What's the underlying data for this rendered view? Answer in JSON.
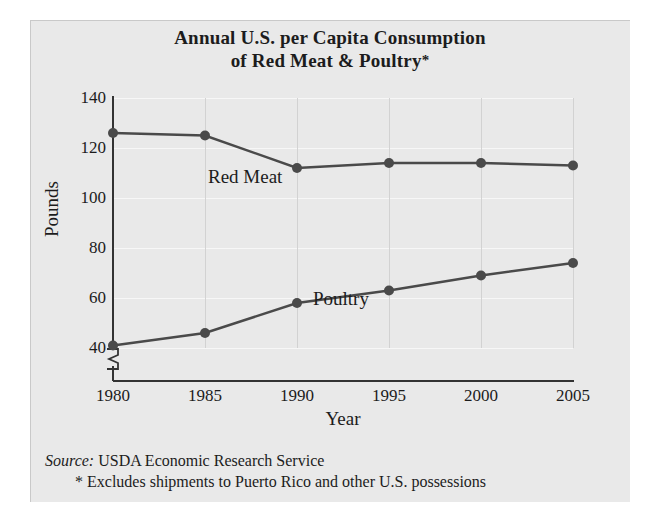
{
  "chart_data": {
    "type": "line",
    "title": "Annual U.S. per Capita Consumption of Red Meat & Poultry*",
    "title_line1": "Annual U.S. per Capita Consumption",
    "title_line2": "of Red Meat & Poultry",
    "title_asterisk": "*",
    "xlabel": "Year",
    "ylabel": "Pounds",
    "categories": [
      1980,
      1985,
      1990,
      1995,
      2000,
      2005
    ],
    "xtick_labels": [
      "1980",
      "1985",
      "1990",
      "1995",
      "2000",
      "2005"
    ],
    "ytick_labels": [
      "140",
      "120",
      "100",
      "80",
      "60",
      "40"
    ],
    "yticks": [
      140,
      120,
      100,
      80,
      60,
      40
    ],
    "ylim": [
      40,
      140
    ],
    "xlim": [
      1980,
      2005
    ],
    "y_axis_broken": true,
    "grid": "both",
    "legend": "inline-labels",
    "series": [
      {
        "name": "Red Meat",
        "label_text": "Red Meat",
        "values": [
          126,
          125,
          112,
          114,
          114,
          113
        ],
        "color": "#4a4a4a",
        "marker": "circle"
      },
      {
        "name": "Poultry",
        "label_text": "Poultry",
        "values": [
          41,
          46,
          58,
          63,
          69,
          74
        ],
        "color": "#4a4a4a",
        "marker": "circle"
      }
    ],
    "source_label": "Source:",
    "source_text": "USDA Economic Research Service",
    "footnote": "* Excludes shipments to Puerto Rico and other U.S. possessions",
    "colors": {
      "panel_background": "#e9e9e9",
      "axis": "#333333",
      "line": "#4a4a4a",
      "text": "#1c1c1c",
      "vertical_gridline": "#d2d2d2",
      "horizontal_gridline": "#f7f7f7"
    }
  }
}
